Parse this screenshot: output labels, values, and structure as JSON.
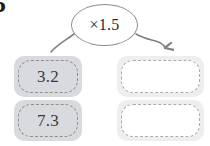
{
  "exercise": {
    "number": "5"
  },
  "operator": {
    "label": "×1.5",
    "bubble_name": "multiply-by-1.5",
    "stroke_color": "#8d8f92"
  },
  "arrows": {
    "left": {
      "name": "arrow-to-input-column",
      "has_arrowhead": false,
      "color": "#7f8184"
    },
    "right": {
      "name": "arrow-to-output-column",
      "has_arrowhead": true,
      "color": "#7f8184"
    }
  },
  "colors": {
    "filled_cell_bg": "#d9dade",
    "blank_cell_bg": "#eceef0",
    "blank_cell_inner": "#ffffff",
    "dash_border": "#9b9da0",
    "text": "#3a3a3a"
  },
  "rows": [
    {
      "input": {
        "value": "3.2",
        "filled": true
      },
      "output": {
        "value": "",
        "filled": false
      }
    },
    {
      "input": {
        "value": "7.3",
        "filled": true
      },
      "output": {
        "value": "",
        "filled": false
      }
    }
  ]
}
